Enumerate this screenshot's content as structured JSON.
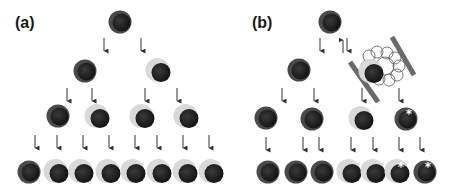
{
  "panels": [
    {
      "label": "(a)",
      "label_pos": [
        15,
        28
      ],
      "cells": [
        {
          "x": 120,
          "y": 22,
          "type": "dark"
        },
        {
          "x": 85,
          "y": 71,
          "type": "dark"
        },
        {
          "x": 159,
          "y": 71,
          "type": "light"
        },
        {
          "x": 58,
          "y": 116,
          "type": "dark"
        },
        {
          "x": 98,
          "y": 117,
          "type": "light"
        },
        {
          "x": 143,
          "y": 117,
          "type": "light"
        },
        {
          "x": 187,
          "y": 117,
          "type": "light"
        },
        {
          "x": 29,
          "y": 172,
          "type": "dark"
        },
        {
          "x": 57,
          "y": 172,
          "type": "light"
        },
        {
          "x": 82,
          "y": 172,
          "type": "light"
        },
        {
          "x": 109,
          "y": 172,
          "type": "light"
        },
        {
          "x": 134,
          "y": 172,
          "type": "light"
        },
        {
          "x": 160,
          "y": 172,
          "type": "light"
        },
        {
          "x": 186,
          "y": 172,
          "type": "light"
        },
        {
          "x": 212,
          "y": 172,
          "type": "light"
        }
      ],
      "arrows": [
        {
          "x": 104,
          "y1": 38,
          "y2": 53,
          "dir": "down"
        },
        {
          "x": 141,
          "y1": 38,
          "y2": 53,
          "dir": "down"
        },
        {
          "x": 67,
          "y1": 88,
          "y2": 103,
          "dir": "down"
        },
        {
          "x": 92,
          "y1": 88,
          "y2": 103,
          "dir": "down"
        },
        {
          "x": 145,
          "y1": 88,
          "y2": 103,
          "dir": "down"
        },
        {
          "x": 177,
          "y1": 88,
          "y2": 103,
          "dir": "down"
        },
        {
          "x": 35,
          "y1": 135,
          "y2": 150,
          "dir": "down"
        },
        {
          "x": 57,
          "y1": 135,
          "y2": 150,
          "dir": "down"
        },
        {
          "x": 83,
          "y1": 135,
          "y2": 150,
          "dir": "down"
        },
        {
          "x": 109,
          "y1": 135,
          "y2": 150,
          "dir": "down"
        },
        {
          "x": 135,
          "y1": 135,
          "y2": 150,
          "dir": "down"
        },
        {
          "x": 157,
          "y1": 135,
          "y2": 150,
          "dir": "down"
        },
        {
          "x": 183,
          "y1": 135,
          "y2": 150,
          "dir": "down"
        },
        {
          "x": 209,
          "y1": 135,
          "y2": 150,
          "dir": "down"
        }
      ]
    },
    {
      "label": "(b)",
      "label_pos": [
        252,
        28
      ],
      "cells": [
        {
          "x": 330,
          "y": 22,
          "type": "dark"
        },
        {
          "x": 299,
          "y": 70,
          "type": "dark"
        },
        {
          "x": 372,
          "y": 72,
          "type": "light",
          "in_niche": true
        },
        {
          "x": 266,
          "y": 118,
          "type": "dark"
        },
        {
          "x": 312,
          "y": 119,
          "type": "dark"
        },
        {
          "x": 362,
          "y": 119,
          "type": "light"
        },
        {
          "x": 406,
          "y": 119,
          "type": "dark",
          "marked": true
        },
        {
          "x": 268,
          "y": 172,
          "type": "dark"
        },
        {
          "x": 296,
          "y": 172,
          "type": "dark"
        },
        {
          "x": 322,
          "y": 172,
          "type": "dark"
        },
        {
          "x": 350,
          "y": 172,
          "type": "light"
        },
        {
          "x": 374,
          "y": 172,
          "type": "light"
        },
        {
          "x": 398,
          "y": 172,
          "type": "light",
          "marked": true
        },
        {
          "x": 425,
          "y": 172,
          "type": "dark",
          "marked": true
        }
      ],
      "arrows": [
        {
          "x": 320,
          "y1": 38,
          "y2": 53,
          "dir": "down"
        },
        {
          "x": 343,
          "y1": 38,
          "y2": 53,
          "dir": "up"
        },
        {
          "x": 347,
          "y1": 38,
          "y2": 53,
          "dir": "down"
        },
        {
          "x": 282,
          "y1": 88,
          "y2": 103,
          "dir": "down"
        },
        {
          "x": 314,
          "y1": 88,
          "y2": 103,
          "dir": "down"
        },
        {
          "x": 362,
          "y1": 88,
          "y2": 103,
          "dir": "down"
        },
        {
          "x": 399,
          "y1": 88,
          "y2": 103,
          "dir": "down"
        },
        {
          "x": 266,
          "y1": 137,
          "y2": 152,
          "dir": "down"
        },
        {
          "x": 303,
          "y1": 137,
          "y2": 152,
          "dir": "down"
        },
        {
          "x": 319,
          "y1": 137,
          "y2": 152,
          "dir": "down"
        },
        {
          "x": 351,
          "y1": 137,
          "y2": 152,
          "dir": "down"
        },
        {
          "x": 373,
          "y1": 137,
          "y2": 152,
          "dir": "down"
        },
        {
          "x": 399,
          "y1": 137,
          "y2": 152,
          "dir": "down"
        },
        {
          "x": 420,
          "y1": 137,
          "y2": 152,
          "dir": "down"
        }
      ],
      "niche": {
        "bars": [
          {
            "x1": 350,
            "y1": 62,
            "x2": 378,
            "y2": 102
          },
          {
            "x1": 392,
            "y1": 37,
            "x2": 414,
            "y2": 75
          }
        ],
        "mesh_center": [
          383,
          66
        ]
      }
    }
  ],
  "colors": {
    "nucleus": "#1e1e1e",
    "dark_ring": "#4a4a4a",
    "light_ring": "#d9d9d9",
    "arrow": "#333333",
    "niche_bar": "#6a6a6a",
    "mesh": "#555555",
    "marker": "#ffffff"
  }
}
